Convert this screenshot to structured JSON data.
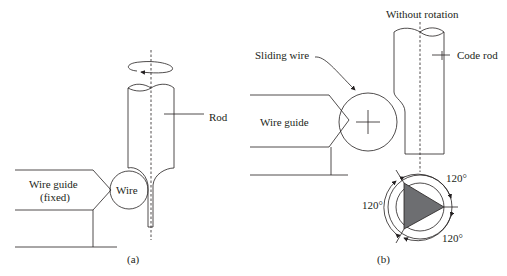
{
  "figure": {
    "panel_a": {
      "caption": "(a)",
      "labels": {
        "rod": "Rod",
        "wire": "Wire",
        "wire_guide_line1": "Wire guide",
        "wire_guide_line2": "(fixed)"
      },
      "rotation_indicator": "rotation-arrow"
    },
    "panel_b": {
      "caption": "(b)",
      "labels": {
        "without_rotation": "Without rotation",
        "code_rod": "Code rod",
        "sliding_wire": "Sliding wire",
        "wire_guide": "Wire guide"
      },
      "angles": [
        "120°",
        "120°",
        "120°"
      ]
    },
    "colors": {
      "line": "#231f20",
      "triangle_fill": "#6d6e71",
      "background": "#ffffff"
    }
  }
}
